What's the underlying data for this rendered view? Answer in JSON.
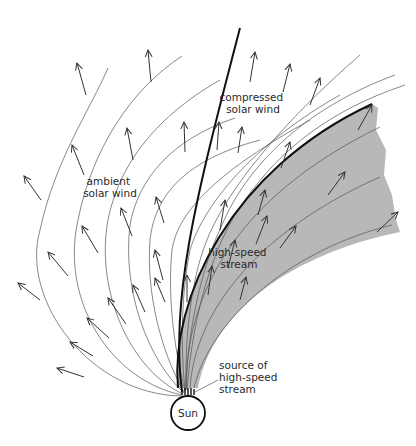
{
  "figure": {
    "labels": {
      "compressed": [
        "compressed",
        "solar wind"
      ],
      "ambient": [
        "ambient",
        "solar wind"
      ],
      "high_speed": [
        "high-speed",
        "stream"
      ],
      "source": [
        "source of",
        "high-speed",
        "stream"
      ],
      "sun": "Sun"
    },
    "colors": {
      "stream_fill": "#b8b8b8",
      "line": "#333333",
      "front": "#111111",
      "background": "#ffffff"
    }
  }
}
